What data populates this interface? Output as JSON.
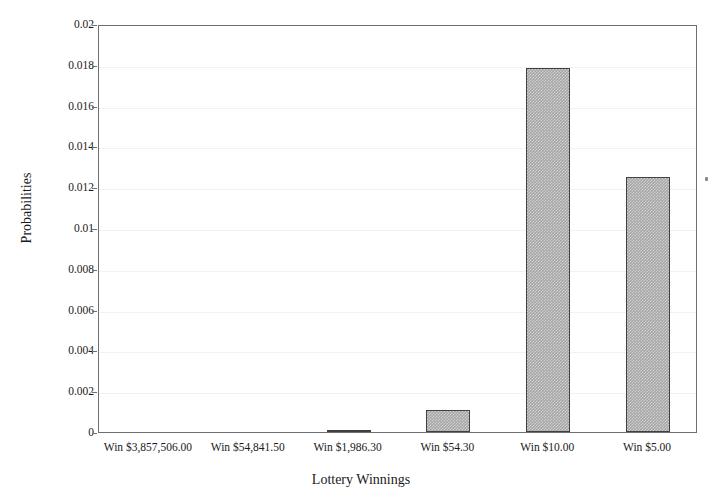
{
  "chart_data": {
    "type": "bar",
    "title": "",
    "xlabel": "Lottery Winnings",
    "ylabel": "Probabilities",
    "categories": [
      "Win $3,857,506.00",
      "Win $54,841.50",
      "Win $1,986.30",
      "Win $54.30",
      "Win $10.00",
      "Win $5.00"
    ],
    "values": [
      3e-07,
      2e-05,
      0.0001,
      0.00108,
      0.01784,
      0.0125
    ],
    "ylim": [
      0,
      0.02
    ],
    "ytick_labels": [
      "0",
      "0.002",
      "0.004",
      "0.006",
      "0.008",
      "0.01",
      "0.012",
      "0.014",
      "0.016",
      "0.018",
      "0.02"
    ],
    "ytick_values": [
      0,
      0.002,
      0.004,
      0.006,
      0.008,
      0.01,
      0.012,
      0.014,
      0.016,
      0.018,
      0.02
    ],
    "grid": true,
    "legend": false,
    "bar_color": "#a5a5a5",
    "bar_border_color": "#404040",
    "axis_color": "#6f6f6f",
    "background": "#ffffff"
  }
}
